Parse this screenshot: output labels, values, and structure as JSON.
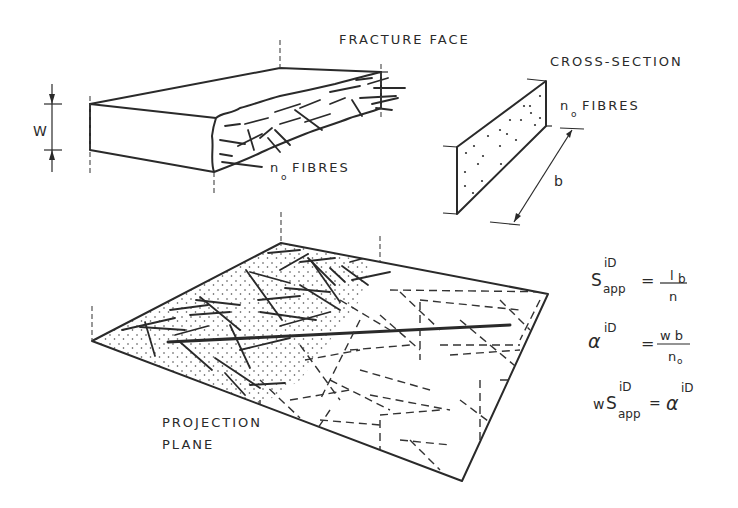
{
  "diagram": {
    "labels": {
      "fracture_face": "FRACTURE FACE",
      "cross_section": "CROSS-SECTION",
      "n0_fibres_block": "FIBRES",
      "n0_fibres_section": "FIBRES",
      "n_symbol": "n",
      "n_subscript": "o",
      "width_dim": "W",
      "b_dim": "b",
      "projection_line1": "PROJECTION",
      "projection_line2": "PLANE"
    },
    "equations": [
      {
        "lhs_base": "S",
        "lhs_sup": "iD",
        "lhs_sub": "app",
        "op": "=",
        "num": "l",
        "num_sub": "b",
        "den": "n"
      },
      {
        "lhs_base": "α",
        "lhs_sup": "iD",
        "op": "=",
        "num": "w b",
        "den": "n",
        "den_sub": "o"
      },
      {
        "lhs_pre": "w",
        "lhs_base": "S",
        "lhs_sup": "iD",
        "lhs_sub": "app",
        "op": "=",
        "rhs_base": "α",
        "rhs_sup": "iD"
      }
    ],
    "colors": {
      "ink": "#2a2a2a",
      "background": "#ffffff"
    }
  }
}
